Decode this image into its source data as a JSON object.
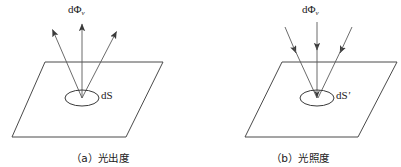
{
  "figure": {
    "width": 401,
    "height": 167,
    "background": "#ffffff",
    "stroke_color": "#4a4a4a",
    "text_color": "#1a1a1a"
  },
  "panels": [
    {
      "id": "panel-a",
      "caption": "（a）光出度",
      "flux_label_main": "dΦ",
      "flux_label_sub": "v",
      "area_label": "dS",
      "area_label_prime": "",
      "arrow_direction": "outward",
      "plane": {
        "top_left": [
          45,
          62
        ],
        "top_right": [
          163,
          62
        ],
        "bottom_right": [
          126,
          137
        ],
        "bottom_left": [
          12,
          137
        ]
      },
      "ellipse": {
        "cx": 82,
        "cy": 98,
        "rx": 17,
        "ry": 8
      },
      "rays": [
        {
          "x1": 82,
          "y1": 98,
          "x2": 51,
          "y2": 27
        },
        {
          "x1": 82,
          "y1": 98,
          "x2": 82,
          "y2": 22
        },
        {
          "x1": 82,
          "y1": 98,
          "x2": 118,
          "y2": 29
        }
      ]
    },
    {
      "id": "panel-b",
      "caption": "（b）光照度",
      "flux_label_main": "dΦ",
      "flux_label_sub": "v",
      "area_label": "dS",
      "area_label_prime": "'",
      "arrow_direction": "inward",
      "plane": {
        "top_left": [
          82,
          62
        ],
        "top_right": [
          197,
          62
        ],
        "bottom_right": [
          158,
          137
        ],
        "bottom_left": [
          45,
          137
        ]
      },
      "ellipse": {
        "cx": 117,
        "cy": 98,
        "rx": 17,
        "ry": 8
      },
      "rays": [
        {
          "x1": 85,
          "y1": 27,
          "x2": 117,
          "y2": 98
        },
        {
          "x1": 117,
          "y1": 22,
          "x2": 117,
          "y2": 98
        },
        {
          "x1": 152,
          "y1": 29,
          "x2": 117,
          "y2": 98
        }
      ]
    }
  ]
}
